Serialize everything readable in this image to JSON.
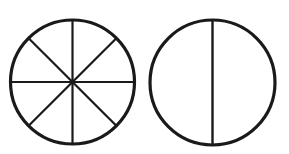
{
  "figure": {
    "background_color": "#ffffff",
    "stroke_color": "#1a1a1a",
    "canvas": {
      "width": 289,
      "height": 154
    },
    "shapes": [
      {
        "name": "circle-eighths",
        "label": "Circle divided into eighths",
        "center_x": 72.5,
        "center_y": 82,
        "radius": 62,
        "outline_width": 3.2,
        "divider_width": 2.2,
        "parts": 8,
        "dividers": [
          {
            "name": "vertical-diameter",
            "angle_deg": 90
          },
          {
            "name": "horizontal-diameter",
            "angle_deg": 0
          },
          {
            "name": "diagonal-diameter-nw-se",
            "angle_deg": 45
          },
          {
            "name": "diagonal-diameter-ne-sw",
            "angle_deg": 135
          }
        ]
      },
      {
        "name": "circle-halves",
        "label": "Circle divided into halves",
        "center_x": 212.5,
        "center_y": 82.5,
        "radius": 62.5,
        "outline_width": 3.2,
        "divider_width": 2.4,
        "parts": 2,
        "dividers": [
          {
            "name": "vertical-diameter",
            "angle_deg": 90
          }
        ]
      }
    ]
  }
}
